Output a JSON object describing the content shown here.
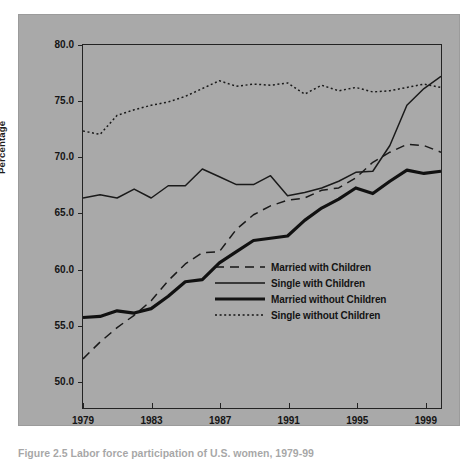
{
  "figure": {
    "caption": "Figure 2.5 Labor force participation of U.S. women, 1979-99",
    "background_color": "#a9a9a9",
    "line_color": "#1a1a1a"
  },
  "chart_data": {
    "type": "line",
    "title": "",
    "subtitle": "",
    "xlabel": "",
    "ylabel": "Percentage",
    "xlim": [
      1979,
      2000
    ],
    "ylim": [
      47.5,
      80.0
    ],
    "grid": false,
    "legend_position": "inside-lower-right",
    "x_tick_labels": [
      "1979",
      "1983",
      "1987",
      "1991",
      "1995",
      "1999"
    ],
    "x_ticks": [
      1979,
      1983,
      1987,
      1991,
      1995,
      1999
    ],
    "y_tick_labels": [
      "80.0",
      "75.0",
      "70.0",
      "65.0",
      "60.0",
      "55.0",
      "50.0"
    ],
    "y_ticks": [
      80.0,
      75.0,
      70.0,
      65.0,
      60.0,
      55.0,
      50.0
    ],
    "x": [
      1979,
      1980,
      1981,
      1982,
      1983,
      1984,
      1985,
      1986,
      1987,
      1988,
      1989,
      1990,
      1991,
      1992,
      1993,
      1994,
      1995,
      1996,
      1997,
      1998,
      1999,
      2000
    ],
    "series": [
      {
        "name": "Married with Children",
        "style": "dashed",
        "width": 1.5,
        "color": "#1a1a1a",
        "values": [
          51.9,
          53.4,
          54.7,
          55.8,
          57.1,
          58.9,
          60.4,
          61.4,
          61.5,
          63.5,
          64.8,
          65.6,
          66.1,
          66.3,
          67.0,
          67.2,
          68.1,
          69.5,
          70.4,
          71.1,
          71.0,
          70.4
        ]
      },
      {
        "name": "Single with Children",
        "style": "solid-thin",
        "width": 1.5,
        "color": "#1a1a1a",
        "values": [
          66.3,
          66.6,
          66.3,
          67.1,
          66.3,
          67.4,
          67.4,
          68.9,
          68.2,
          67.5,
          67.5,
          68.3,
          66.5,
          66.8,
          67.2,
          67.8,
          68.6,
          68.7,
          71.0,
          74.6,
          76.1,
          77.2
        ]
      },
      {
        "name": "Married without Children",
        "style": "solid-thick",
        "width": 3.2,
        "color": "#111111",
        "values": [
          55.6,
          55.7,
          56.2,
          56.0,
          56.4,
          57.5,
          58.8,
          59.0,
          60.5,
          61.5,
          62.5,
          62.7,
          62.9,
          64.3,
          65.4,
          66.2,
          67.2,
          66.7,
          67.8,
          68.8,
          68.5,
          68.7
        ]
      },
      {
        "name": "Single without Children",
        "style": "dotted",
        "width": 1.5,
        "color": "#1a1a1a",
        "values": [
          72.3,
          72.0,
          73.7,
          74.2,
          74.6,
          74.9,
          75.4,
          76.1,
          76.8,
          76.3,
          76.5,
          76.4,
          76.6,
          75.6,
          76.4,
          75.9,
          76.2,
          75.8,
          75.9,
          76.2,
          76.5,
          76.2
        ]
      }
    ]
  },
  "legend": {
    "items": [
      {
        "label": "Married with Children",
        "style": "dashed"
      },
      {
        "label": "Single with Children",
        "style": "solid-thin"
      },
      {
        "label": "Married without Children",
        "style": "solid-thick"
      },
      {
        "label": "Single without Children",
        "style": "dotted"
      }
    ]
  }
}
